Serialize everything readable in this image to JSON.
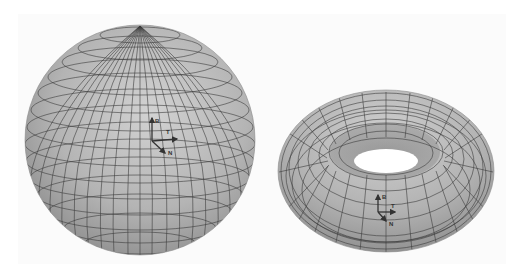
{
  "figure": {
    "background": "#ffffff",
    "surface_color": "#b8b8b8",
    "grid_color": "#3a3a3a",
    "objects": [
      {
        "name": "sphere",
        "frame_labels": {
          "binormal": "B",
          "tangent": "T",
          "normal": "N"
        }
      },
      {
        "name": "torus",
        "frame_labels": {
          "binormal": "B",
          "tangent": "T",
          "normal": "N"
        }
      }
    ]
  }
}
